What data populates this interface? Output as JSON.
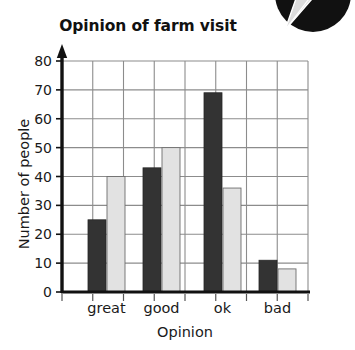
{
  "chart_data": {
    "type": "bar",
    "title": "Opinion of farm visit",
    "xlabel": "Opinion",
    "ylabel": "Number of people",
    "categories": [
      "great",
      "good",
      "ok",
      "bad"
    ],
    "series": [
      {
        "name": "dark",
        "color": "#333333",
        "values": [
          25,
          43,
          69,
          11
        ]
      },
      {
        "name": "light",
        "color": "#e2e2e2",
        "values": [
          40,
          50,
          36,
          8
        ]
      }
    ],
    "ylim": [
      0,
      80
    ],
    "ytick_labels": [
      "0",
      "10",
      "20",
      "30",
      "40",
      "50",
      "60",
      "70",
      "80"
    ],
    "ytick_values": [
      0,
      10,
      20,
      30,
      40,
      50,
      60,
      70,
      80
    ],
    "grid": true,
    "legend": "none",
    "axis_color": "#111111",
    "grid_color": "#8c8c8c"
  },
  "decoration": {
    "corner_shape_name": "dark-circle-with-pointer",
    "circle_color": "#111111",
    "pointer_color": "#d9d9d9"
  }
}
